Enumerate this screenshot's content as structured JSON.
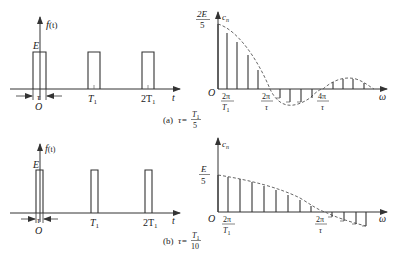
{
  "figure": {
    "panel_a": {
      "caption_prefix": "(a)",
      "caption_lhs": "τ=",
      "caption_num": "T",
      "caption_num_sub": "1",
      "caption_den": "5",
      "time_plot": {
        "y_label": "f",
        "y_label_arg": "(t)",
        "amplitude_label": "E",
        "x_label": "t",
        "origin_label": "O",
        "width_label": "τ",
        "ticks": [
          {
            "main": "T",
            "sub": "1"
          },
          {
            "main": "2T",
            "sub": "1"
          }
        ]
      },
      "spectrum_plot": {
        "y_label": "c",
        "y_label_sub": "n",
        "y_top_num": "2E",
        "y_top_den": "5",
        "x_label": "ω",
        "origin_label": "O",
        "ticks": [
          {
            "num": "2π",
            "den": "T",
            "den_sub": "1"
          },
          {
            "num": "2π",
            "den": "τ",
            "den_sub": ""
          },
          {
            "num": "4π",
            "den": "τ",
            "den_sub": ""
          }
        ]
      }
    },
    "panel_b": {
      "caption_prefix": "(b)",
      "caption_lhs": "τ=",
      "caption_num": "T",
      "caption_num_sub": "1",
      "caption_den": "10",
      "time_plot": {
        "y_label": "f",
        "y_label_arg": "(t)",
        "amplitude_label": "E",
        "x_label": "t",
        "origin_label": "O",
        "width_label": "τ",
        "ticks": [
          {
            "main": "T",
            "sub": "1"
          },
          {
            "main": "2T",
            "sub": "1"
          }
        ]
      },
      "spectrum_plot": {
        "y_label": "c",
        "y_label_sub": "n",
        "y_top_num": "E",
        "y_top_den": "5",
        "x_label": "ω",
        "origin_label": "O",
        "ticks": [
          {
            "num": "2π",
            "den": "T",
            "den_sub": "1"
          },
          {
            "num": "2π",
            "den": "τ",
            "den_sub": ""
          }
        ]
      }
    }
  }
}
